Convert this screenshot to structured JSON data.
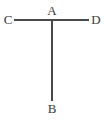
{
  "figure": {
    "background_color": "#ffffff",
    "stroke_color": "#4a4a4a",
    "label_color": "#3a3a3a",
    "width": 105,
    "height": 120
  },
  "labels": {
    "a": "A",
    "b": "B",
    "c": "C",
    "d": "D"
  },
  "chart_data": {
    "type": "diagram",
    "title": "",
    "points": [
      {
        "name": "A",
        "x": 52,
        "y": 20,
        "label_position": "above"
      },
      {
        "name": "B",
        "x": 52,
        "y": 101,
        "label_position": "below"
      },
      {
        "name": "C",
        "x": 14,
        "y": 20,
        "label_position": "left"
      },
      {
        "name": "D",
        "x": 89,
        "y": 20,
        "label_position": "right"
      }
    ],
    "segments": [
      {
        "from": "C",
        "to": "D",
        "orientation": "horizontal"
      },
      {
        "from": "A",
        "to": "B",
        "orientation": "vertical"
      }
    ]
  }
}
